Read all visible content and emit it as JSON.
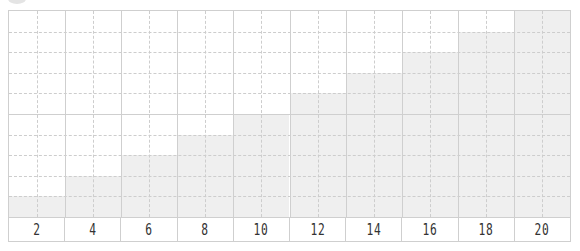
{
  "chart_data": {
    "type": "bar",
    "title": "",
    "xlabel": "",
    "ylabel": "",
    "categories": [
      "2",
      "4",
      "6",
      "8",
      "10",
      "12",
      "14",
      "16",
      "18",
      "20"
    ],
    "values": [
      1,
      2,
      3,
      4,
      5,
      6,
      7,
      8,
      9,
      10
    ],
    "ylim": [
      0,
      10
    ],
    "grid": true,
    "legend": null
  },
  "colors": {
    "bar": "#efefef",
    "grid": "#cdcdcd",
    "border": "#cfcfcf",
    "label": "#333333"
  }
}
